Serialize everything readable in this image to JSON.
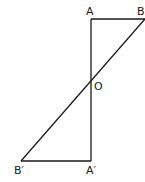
{
  "diagram": {
    "type": "geometry",
    "points": {
      "A": {
        "label": "A",
        "x": 91,
        "y": 19
      },
      "B": {
        "label": "B",
        "x": 145,
        "y": 19
      },
      "O": {
        "label": "O",
        "x": 91,
        "y": 83
      },
      "A_prime": {
        "label": "A′",
        "x": 91,
        "y": 161
      },
      "B_prime": {
        "label": "B′",
        "x": 21,
        "y": 161
      }
    },
    "segments": [
      [
        "A",
        "B"
      ],
      [
        "A",
        "A_prime"
      ],
      [
        "B",
        "B_prime"
      ],
      [
        "B_prime",
        "A_prime"
      ]
    ],
    "line_color": "#1a1a1a"
  }
}
